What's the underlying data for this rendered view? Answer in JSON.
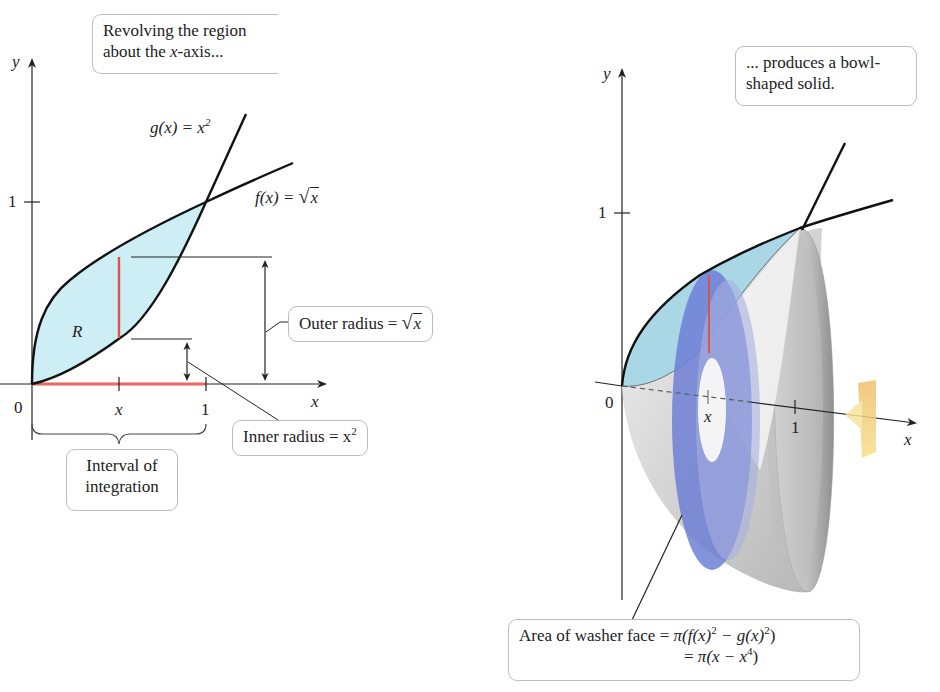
{
  "left_panel": {
    "callout_top": {
      "line1": "Revolving the region",
      "line2_pre": "about the ",
      "line2_var": "x",
      "line2_post": "-axis..."
    },
    "axis_labels": {
      "y": "y",
      "x": "x",
      "origin": "0",
      "x_one": "1",
      "y_one": "1",
      "x_var": "x"
    },
    "region_label": "R",
    "g_label": {
      "name": "g(x) = x",
      "exp": "2"
    },
    "f_label": {
      "name": "f(x) = ",
      "radicand": "x",
      "radical": "√"
    },
    "outer_radius": {
      "text": "Outer radius = ",
      "radical": "√",
      "radicand": "x"
    },
    "inner_radius": {
      "text": "Inner radius = x",
      "exp": "2"
    },
    "interval": {
      "line1": "Interval of",
      "line2": "integration"
    }
  },
  "right_panel": {
    "callout_top": {
      "line1": "... produces a bowl-",
      "line2": "shaped solid."
    },
    "axis_labels": {
      "y": "y",
      "x": "x",
      "origin": "0",
      "x_one": "1",
      "y_one": "1",
      "x_var": "x"
    },
    "washer_callout": {
      "line1_pre": "Area of washer face = ",
      "line1_pi": "π",
      "line1_formula_a": "(f(x)",
      "line1_exp_a": "2",
      "line1_formula_b": " − g(x)",
      "line1_exp_b": "2",
      "line1_close": ")",
      "line2_pre": "= ",
      "line2_pi": "π",
      "line2_formula": "(x − x",
      "line2_exp": "4",
      "line2_close": ")"
    }
  },
  "colors": {
    "region_fill": "#cdeef5",
    "slice_red": "#d9534f",
    "interval_red": "#e8675f",
    "washer_blue": "#6f7fd6",
    "solid_gray": "#c8c8c8",
    "rotation_arrow": "#f2c46e",
    "axis": "#222222"
  }
}
